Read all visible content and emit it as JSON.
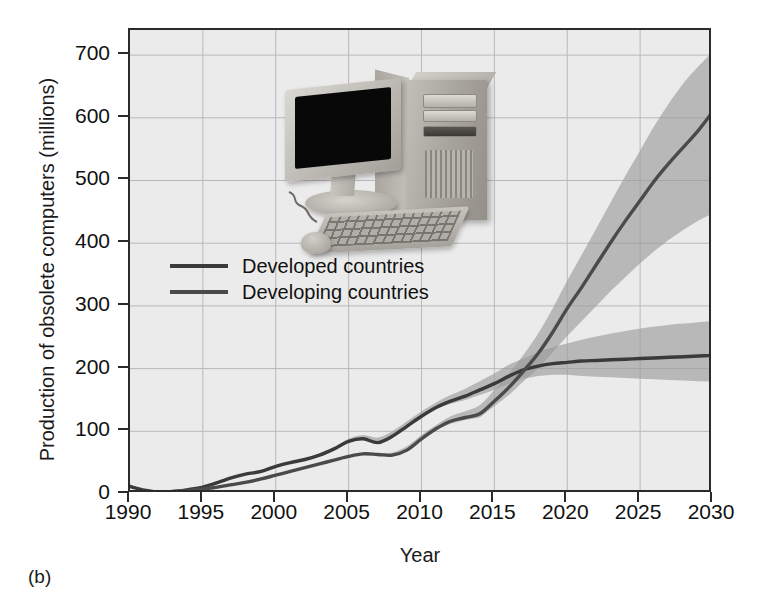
{
  "figure": {
    "panel_label": "(b)",
    "background": "#ffffff"
  },
  "legend": {
    "position": "inside-left",
    "entries": [
      {
        "label": "Developed countries",
        "color": "#3a3a3a"
      },
      {
        "label": "Developing countries",
        "color": "#4a4a4a"
      }
    ]
  },
  "photo": {
    "name": "desktop-computer-photo",
    "description": "Desktop computer with monitor, tower, keyboard and mouse"
  },
  "chart_data": {
    "type": "line",
    "title": "",
    "xlabel": "Year",
    "ylabel": "Production of obsolete computers (millions)",
    "xlim": [
      1990,
      2030
    ],
    "ylim": [
      0,
      740
    ],
    "yticks": [
      0,
      100,
      200,
      300,
      400,
      500,
      600,
      700
    ],
    "xticks": [
      1990,
      1995,
      2000,
      2005,
      2010,
      2015,
      2020,
      2025,
      2030
    ],
    "ytick_labels": [
      "0",
      "100",
      "200",
      "300",
      "400",
      "500",
      "600",
      "700"
    ],
    "xtick_labels": [
      "1990",
      "1995",
      "2000",
      "2005",
      "2010",
      "2015",
      "2020",
      "2025",
      "2030"
    ],
    "grid": true,
    "legend_position": "inside upper-left",
    "band_color": "#9a9a9a",
    "x": [
      1990,
      1991,
      1992,
      1993,
      1994,
      1995,
      1996,
      1997,
      1998,
      1999,
      2000,
      2001,
      2002,
      2003,
      2004,
      2005,
      2006,
      2007,
      2008,
      2009,
      2010,
      2011,
      2012,
      2013,
      2014,
      2015,
      2016,
      2017,
      2018,
      2019,
      2020,
      2021,
      2022,
      2023,
      2024,
      2025,
      2026,
      2027,
      2028,
      2029,
      2030
    ],
    "series": [
      {
        "name": "Developed countries",
        "color": "#3a3a3a",
        "values": [
          12,
          6,
          3,
          4,
          7,
          11,
          18,
          26,
          32,
          36,
          44,
          50,
          55,
          62,
          72,
          84,
          88,
          82,
          92,
          108,
          124,
          138,
          148,
          156,
          166,
          176,
          188,
          198,
          204,
          208,
          210,
          212,
          213,
          214,
          215,
          216,
          217,
          218,
          219,
          220,
          221
        ],
        "band_low": [
          12,
          6,
          3,
          4,
          7,
          11,
          18,
          26,
          32,
          36,
          44,
          50,
          55,
          62,
          72,
          84,
          88,
          82,
          92,
          108,
          124,
          136,
          144,
          150,
          158,
          166,
          176,
          184,
          188,
          190,
          190,
          188,
          187,
          186,
          185,
          184,
          183,
          182,
          181,
          180,
          179
        ],
        "band_high": [
          12,
          6,
          3,
          4,
          7,
          11,
          18,
          26,
          32,
          36,
          44,
          50,
          55,
          62,
          74,
          88,
          94,
          90,
          100,
          116,
          132,
          146,
          158,
          168,
          180,
          192,
          206,
          216,
          226,
          234,
          240,
          246,
          251,
          256,
          260,
          264,
          267,
          270,
          272,
          274,
          276
        ]
      },
      {
        "name": "Developing countries",
        "color": "#4a4a4a",
        "values": [
          2,
          2,
          3,
          4,
          6,
          8,
          11,
          15,
          19,
          24,
          30,
          36,
          42,
          48,
          54,
          60,
          64,
          63,
          62,
          70,
          88,
          104,
          116,
          122,
          128,
          148,
          170,
          196,
          224,
          258,
          296,
          330,
          366,
          402,
          436,
          468,
          500,
          528,
          554,
          580,
          610
        ],
        "band_low": [
          2,
          2,
          3,
          4,
          6,
          8,
          11,
          15,
          19,
          24,
          30,
          36,
          42,
          48,
          54,
          60,
          64,
          63,
          62,
          70,
          88,
          102,
          112,
          118,
          122,
          140,
          158,
          180,
          200,
          226,
          252,
          276,
          300,
          324,
          346,
          368,
          388,
          406,
          422,
          436,
          448
        ],
        "band_high": [
          2,
          2,
          3,
          4,
          6,
          8,
          11,
          15,
          19,
          24,
          30,
          36,
          42,
          48,
          54,
          60,
          66,
          65,
          66,
          76,
          94,
          110,
          124,
          132,
          142,
          166,
          192,
          222,
          256,
          296,
          340,
          382,
          424,
          466,
          508,
          548,
          588,
          624,
          656,
          682,
          706
        ]
      }
    ]
  }
}
